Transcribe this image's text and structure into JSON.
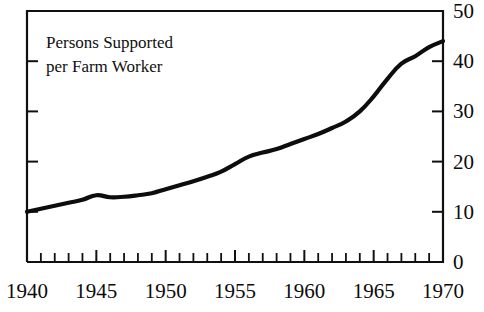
{
  "chart_data": {
    "type": "line",
    "title": "Persons Supported per Farm Worker",
    "title_line1": "Persons Supported",
    "title_line2": "per Farm Worker",
    "xlabel": "",
    "ylabel": "",
    "xlim": [
      1940,
      1970
    ],
    "ylim": [
      0,
      50
    ],
    "grid": false,
    "legend": false,
    "y_axis_position": "right",
    "x_tick_labels": [
      "1940",
      "1945",
      "1950",
      "1955",
      "1960",
      "1965",
      "1970"
    ],
    "x_tick_values": [
      1940,
      1945,
      1950,
      1955,
      1960,
      1965,
      1970
    ],
    "x_minor_tick_step": 1,
    "y_tick_labels": [
      "0",
      "10",
      "20",
      "30",
      "40",
      "50"
    ],
    "y_tick_values": [
      0,
      10,
      20,
      30,
      40,
      50
    ],
    "line_color": "#0d0d0d",
    "x": [
      1940,
      1941,
      1942,
      1943,
      1944,
      1945,
      1946,
      1947,
      1948,
      1949,
      1950,
      1951,
      1952,
      1953,
      1954,
      1955,
      1956,
      1957,
      1958,
      1959,
      1960,
      1961,
      1962,
      1963,
      1964,
      1965,
      1966,
      1967,
      1968,
      1969,
      1970
    ],
    "values": [
      10.0,
      10.6,
      11.2,
      11.8,
      12.4,
      13.3,
      12.9,
      13.0,
      13.3,
      13.7,
      14.5,
      15.3,
      16.1,
      17.0,
      18.0,
      19.5,
      21.0,
      21.8,
      22.5,
      23.5,
      24.5,
      25.5,
      26.7,
      28.0,
      30.0,
      33.0,
      36.5,
      39.5,
      41.0,
      42.8,
      44.0
    ],
    "series": [
      {
        "name": "Persons Supported per Farm Worker",
        "values": [
          10.0,
          10.6,
          11.2,
          11.8,
          12.4,
          13.3,
          12.9,
          13.0,
          13.3,
          13.7,
          14.5,
          15.3,
          16.1,
          17.0,
          18.0,
          19.5,
          21.0,
          21.8,
          22.5,
          23.5,
          24.5,
          25.5,
          26.7,
          28.0,
          30.0,
          33.0,
          36.5,
          39.5,
          41.0,
          42.8,
          44.0
        ]
      }
    ],
    "annotations": []
  }
}
